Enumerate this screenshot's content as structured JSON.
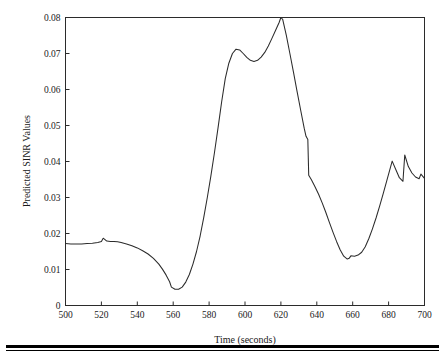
{
  "chart_data": {
    "type": "line",
    "title": "",
    "xlabel": "Time (seconds)",
    "ylabel": "Predicted SINR Values",
    "xlim": [
      500,
      700
    ],
    "ylim": [
      0,
      0.08
    ],
    "xticks": [
      500,
      520,
      540,
      560,
      580,
      600,
      620,
      640,
      660,
      680,
      700
    ],
    "xticklabels": [
      "500",
      "520",
      "540",
      "560",
      "580",
      "600",
      "620",
      "640",
      "660",
      "680",
      "700"
    ],
    "yticks": [
      0,
      0.01,
      0.02,
      0.03,
      0.04,
      0.05,
      0.06,
      0.07,
      0.08
    ],
    "yticklabels": [
      "0",
      "0.01",
      "0.02",
      "0.03",
      "0.04",
      "0.05",
      "0.06",
      "0.07",
      "0.08"
    ],
    "grid": false,
    "legend": null,
    "line_color": "#2b2b2b",
    "series": [
      {
        "name": "Predicted SINR",
        "x": [
          500,
          503,
          506,
          509,
          512,
          515,
          518,
          520,
          521,
          523,
          525,
          527,
          529,
          531,
          534,
          537,
          540,
          543,
          546,
          549,
          552,
          554,
          556,
          558,
          559,
          561,
          563,
          565,
          567,
          569,
          571,
          573,
          575,
          577,
          579,
          581,
          583,
          585,
          587,
          589,
          591,
          593,
          595,
          597,
          599,
          601,
          603,
          605,
          607,
          609,
          611,
          613,
          615,
          617,
          619,
          620,
          621,
          623,
          625,
          627,
          629,
          631,
          633,
          634,
          635,
          635.5,
          637,
          639,
          641,
          643,
          645,
          647,
          649,
          651,
          653,
          655,
          657,
          658,
          659,
          661,
          663,
          665,
          667,
          669,
          671,
          673,
          675,
          677,
          679,
          681,
          682,
          684,
          686,
          688,
          689,
          691,
          693,
          695,
          697,
          698,
          700
        ],
        "y": [
          0.0172,
          0.0171,
          0.0171,
          0.0171,
          0.0172,
          0.0173,
          0.0175,
          0.0178,
          0.0187,
          0.0179,
          0.0178,
          0.0178,
          0.0177,
          0.0175,
          0.0171,
          0.0166,
          0.016,
          0.0152,
          0.0143,
          0.0131,
          0.0115,
          0.0101,
          0.0085,
          0.0066,
          0.0051,
          0.0045,
          0.0045,
          0.0051,
          0.0065,
          0.0086,
          0.0115,
          0.015,
          0.0193,
          0.0244,
          0.03,
          0.036,
          0.0425,
          0.0494,
          0.0566,
          0.063,
          0.0673,
          0.07,
          0.0712,
          0.071,
          0.07,
          0.0689,
          0.0681,
          0.0678,
          0.0681,
          0.069,
          0.0703,
          0.0721,
          0.0742,
          0.0764,
          0.0786,
          0.08,
          0.0795,
          0.0751,
          0.07,
          0.0648,
          0.0595,
          0.0543,
          0.0492,
          0.047,
          0.0461,
          0.0362,
          0.0349,
          0.033,
          0.0309,
          0.0285,
          0.0259,
          0.0231,
          0.0204,
          0.0178,
          0.0155,
          0.0137,
          0.0129,
          0.0131,
          0.0138,
          0.0137,
          0.014,
          0.0148,
          0.0163,
          0.0186,
          0.0213,
          0.0243,
          0.0276,
          0.0311,
          0.0347,
          0.0383,
          0.0401,
          0.0378,
          0.0355,
          0.0345,
          0.0418,
          0.0386,
          0.0368,
          0.0357,
          0.0352,
          0.0365,
          0.0353
        ]
      }
    ]
  }
}
